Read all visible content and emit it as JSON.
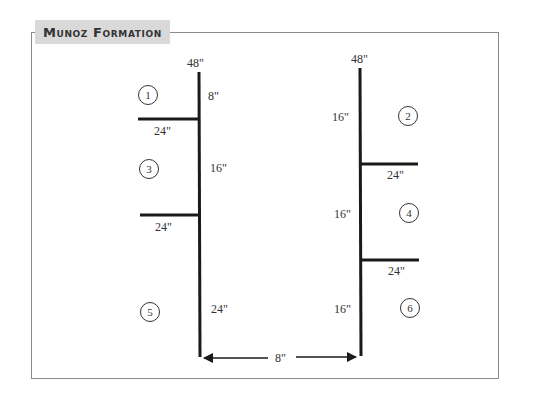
{
  "title": "Munoz Formation",
  "left_pole": {
    "height_label": "48\"",
    "segments": [
      {
        "label": "8\""
      },
      {
        "label": "16\""
      },
      {
        "label": "24\""
      }
    ],
    "arms": [
      {
        "label": "24\""
      },
      {
        "label": "24\""
      }
    ]
  },
  "right_pole": {
    "height_label": "48\"",
    "segments": [
      {
        "label": "16\""
      },
      {
        "label": "16\""
      },
      {
        "label": "16\""
      }
    ],
    "arms": [
      {
        "label": "24\""
      },
      {
        "label": "24\""
      }
    ]
  },
  "spacing": {
    "label": "8\""
  },
  "positions": [
    {
      "number": "1"
    },
    {
      "number": "2"
    },
    {
      "number": "3"
    },
    {
      "number": "4"
    },
    {
      "number": "5"
    },
    {
      "number": "6"
    }
  ],
  "colors": {
    "frame": "#8a8a8a",
    "title_bg": "#d9d9d9",
    "line": "#1a1a1a",
    "text": "#333333"
  }
}
